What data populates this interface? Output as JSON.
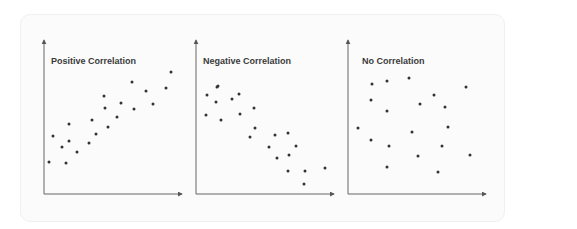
{
  "chart_data": [
    {
      "type": "scatter",
      "title": "Positive Correlation",
      "xlabel": "",
      "ylabel": "",
      "axes": "arrows, no ticks",
      "grid": false,
      "legend": null,
      "points_px": [
        [
          49,
          162
        ],
        [
          53,
          136
        ],
        [
          62,
          147
        ],
        [
          69,
          124
        ],
        [
          66,
          163
        ],
        [
          69,
          141
        ],
        [
          77,
          152
        ],
        [
          89,
          143
        ],
        [
          92,
          120
        ],
        [
          96,
          134
        ],
        [
          104,
          96
        ],
        [
          105,
          108
        ],
        [
          108,
          127
        ],
        [
          117,
          117
        ],
        [
          121,
          103
        ],
        [
          132,
          82
        ],
        [
          134,
          109
        ],
        [
          146,
          91
        ],
        [
          153,
          104
        ],
        [
          166,
          88
        ],
        [
          171,
          72
        ]
      ]
    },
    {
      "type": "scatter",
      "title": "Negative Correlation",
      "xlabel": "",
      "ylabel": "",
      "axes": "arrows, no ticks",
      "grid": false,
      "legend": null,
      "points_px": [
        [
          206,
          115
        ],
        [
          207,
          95
        ],
        [
          217,
          87
        ],
        [
          216,
          102
        ],
        [
          221,
          120
        ],
        [
          218,
          86
        ],
        [
          232,
          99
        ],
        [
          239,
          94
        ],
        [
          240,
          114
        ],
        [
          254,
          108
        ],
        [
          250,
          137
        ],
        [
          255,
          128
        ],
        [
          269,
          147
        ],
        [
          277,
          158
        ],
        [
          275,
          135
        ],
        [
          288,
          171
        ],
        [
          288,
          133
        ],
        [
          296,
          146
        ],
        [
          289,
          155
        ],
        [
          305,
          171
        ],
        [
          304,
          184
        ],
        [
          325,
          168
        ]
      ]
    },
    {
      "type": "scatter",
      "title": "No Correlation",
      "xlabel": "",
      "ylabel": "",
      "axes": "arrows, no ticks",
      "grid": false,
      "legend": null,
      "points_px": [
        [
          358,
          128
        ],
        [
          371,
          100
        ],
        [
          372,
          84
        ],
        [
          371,
          140
        ],
        [
          387,
          81
        ],
        [
          387,
          111
        ],
        [
          389,
          146
        ],
        [
          387,
          167
        ],
        [
          409,
          78
        ],
        [
          412,
          132
        ],
        [
          418,
          156
        ],
        [
          420,
          104
        ],
        [
          434,
          95
        ],
        [
          438,
          172
        ],
        [
          442,
          146
        ],
        [
          445,
          107
        ],
        [
          448,
          127
        ],
        [
          466,
          87
        ],
        [
          470,
          155
        ]
      ]
    }
  ],
  "panels": [
    {
      "title": "Positive Correlation"
    },
    {
      "title": "Negative Correlation"
    },
    {
      "title": "No Correlation"
    }
  ],
  "style": {
    "axis_color": "#555555",
    "dot_color": "#333333",
    "title_color": "#3a3a3a",
    "card_bg": "#fbfbfb"
  }
}
